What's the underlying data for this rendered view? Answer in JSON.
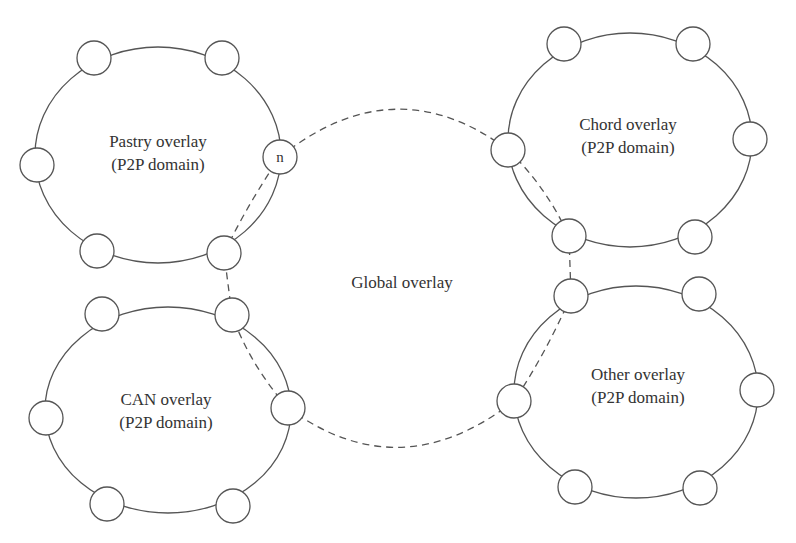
{
  "diagram": {
    "global": {
      "label": "Global overlay"
    },
    "overlays": [
      {
        "name": "pastry",
        "line1": "Pastry overlay",
        "line2": "(P2P domain)"
      },
      {
        "name": "chord",
        "line1": "Chord overlay",
        "line2": "(P2P domain)"
      },
      {
        "name": "can",
        "line1": "CAN overlay",
        "line2": "(P2P domain)"
      },
      {
        "name": "other",
        "line1": "Other overlay",
        "line2": "(P2P domain)"
      }
    ],
    "special_node_label": "n"
  }
}
